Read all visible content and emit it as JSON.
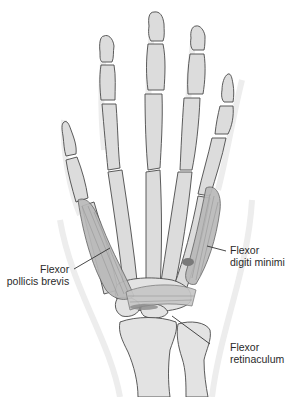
{
  "figure": {
    "labels": [
      {
        "id": "flexor-pollicis-brevis",
        "line1": "Flexor",
        "line2": "pollicis brevis"
      },
      {
        "id": "flexor-digiti-minimi",
        "line1": "Flexor",
        "line2": "digiti minimi"
      },
      {
        "id": "flexor-retinaculum",
        "line1": "Flexor",
        "line2": "retinaculum"
      }
    ]
  },
  "colors": {
    "bone_fill": "#dcdcdc",
    "bone_outline": "#4a4a4a",
    "muscle_fill": "#b9b9b9",
    "background": "#ffffff",
    "label_text": "#2a2a2a"
  }
}
